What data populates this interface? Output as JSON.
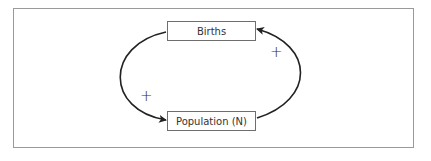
{
  "diagram": {
    "type": "causal-loop",
    "nodes": [
      {
        "id": "births",
        "label": "Births"
      },
      {
        "id": "population",
        "label": "Population (N)"
      }
    ],
    "links": [
      {
        "from": "births",
        "to": "population",
        "polarity": "+"
      },
      {
        "from": "population",
        "to": "births",
        "polarity": "+"
      }
    ]
  }
}
